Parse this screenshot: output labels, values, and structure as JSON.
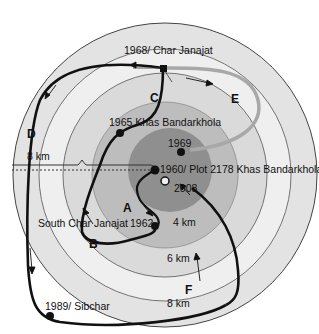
{
  "diagram": {
    "type": "concentric distance rings with migration paths",
    "center": {
      "x": 165,
      "y": 175
    },
    "rings": [
      {
        "name": "outer",
        "radius": 152,
        "fill": "#e2e2e2"
      },
      {
        "name": "8km-ring",
        "radius": 126,
        "fill": "#efefef"
      },
      {
        "name": "6km-ring",
        "radius": 102,
        "fill": "#d9d9d9"
      },
      {
        "name": "4km-ring",
        "radius": 73,
        "fill": "#bcbcbc"
      },
      {
        "name": "inner",
        "radius": 40,
        "fill": "#8f8f8f"
      }
    ],
    "places": [
      {
        "id": "char-janajat",
        "label": "1968/ Char Janajat"
      },
      {
        "id": "khas-1965",
        "label": "1965 Khas Bandarkhola"
      },
      {
        "id": "y1969",
        "label": "1969"
      },
      {
        "id": "plot2178",
        "label": "1960/ Plot 2178 Khas Bandarkhola"
      },
      {
        "id": "y2008",
        "label": "2008"
      },
      {
        "id": "south-char",
        "label": "South Char Janajat"
      },
      {
        "id": "y1962",
        "label": "1962"
      },
      {
        "id": "sibchar",
        "label": "1989/ Sibchar"
      }
    ],
    "path_labels": [
      "A",
      "B",
      "C",
      "D",
      "E",
      "F"
    ],
    "distances": {
      "d8_left": "8 km",
      "d4": "4 km",
      "d6": "6 km",
      "d8_bottom": "8 km"
    },
    "colors": {
      "path_dark": "#111111",
      "path_grey": "#a8a8a8",
      "ring_stroke": "#555555"
    }
  }
}
